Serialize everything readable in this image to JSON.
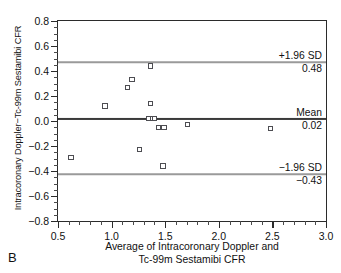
{
  "panel": {
    "letter": "B"
  },
  "chart_data": {
    "type": "scatter",
    "title": "",
    "xlabel": "Average of Intracoronary Doppler and Tc-99m Sestamibi CFR",
    "xlabel_line1": "Average of Intracoronary Doppler and",
    "xlabel_line2": "Tc-99m Sestamibi CFR",
    "ylabel": "Intracoronary Doppler−Tc-99m Sestamibi CFR",
    "xlim": [
      0.5,
      3.0
    ],
    "ylim": [
      -0.8,
      0.8
    ],
    "xticks": [
      0.5,
      1.0,
      1.5,
      2.0,
      2.5,
      3.0
    ],
    "xtick_labels": [
      "0.5",
      "1.0",
      "1.5",
      "2.0",
      "2.5",
      "3.0"
    ],
    "xtick_minor_step": 0.1,
    "yticks": [
      0.8,
      0.6,
      0.4,
      0.2,
      0.0,
      -0.2,
      -0.4,
      -0.6,
      -0.8
    ],
    "ytick_labels": [
      "0.8",
      "0.6",
      "0.4",
      "0.2",
      "0.0",
      "−0.2",
      "−0.4",
      "−0.6",
      "−0.8"
    ],
    "ytick_minor_step": 0.05,
    "grid": false,
    "legend": null,
    "marker_style": "open-square",
    "points": [
      {
        "x": 0.62,
        "y": -0.29
      },
      {
        "x": 0.94,
        "y": 0.12
      },
      {
        "x": 1.15,
        "y": 0.27
      },
      {
        "x": 1.19,
        "y": 0.33
      },
      {
        "x": 1.26,
        "y": -0.23
      },
      {
        "x": 1.36,
        "y": 0.44
      },
      {
        "x": 1.36,
        "y": 0.14
      },
      {
        "x": 1.35,
        "y": 0.02
      },
      {
        "x": 1.38,
        "y": 0.02
      },
      {
        "x": 1.4,
        "y": 0.02
      },
      {
        "x": 1.44,
        "y": -0.05
      },
      {
        "x": 1.49,
        "y": -0.05
      },
      {
        "x": 1.48,
        "y": -0.36
      },
      {
        "x": 1.71,
        "y": -0.03
      },
      {
        "x": 2.48,
        "y": -0.06
      }
    ],
    "reference_lines": [
      {
        "name": "upper-limit-of-agreement",
        "label": "+1.96 SD",
        "value_label": "0.48",
        "y": 0.47,
        "style": "light"
      },
      {
        "name": "mean-bias",
        "label": "Mean",
        "value_label": "0.02",
        "y": 0.02,
        "style": "dark"
      },
      {
        "name": "lower-limit-of-agreement",
        "label": "−1.96 SD",
        "value_label": "−0.43",
        "y": -0.425,
        "style": "light"
      }
    ],
    "colors": {
      "axis": "#2b2b2b",
      "marker_edge": "#4d4d52",
      "mean_line": "#3a3a3a",
      "sd_line": "#9a9a9a",
      "text": "#111111",
      "background": "#ffffff"
    }
  }
}
